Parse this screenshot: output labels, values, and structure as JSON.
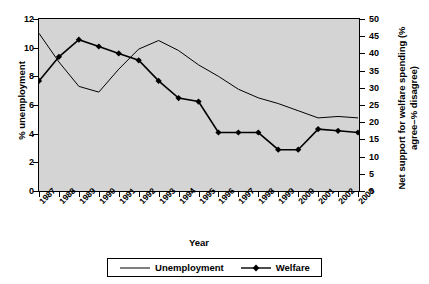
{
  "chart_data": {
    "type": "line",
    "title": "",
    "xlabel": "Year",
    "categories": [
      "1987",
      "1988",
      "1989",
      "1990",
      "1991",
      "1992",
      "1993",
      "1994",
      "1995",
      "1996",
      "1997",
      "1998",
      "1999",
      "2000",
      "2001",
      "2002",
      "2003"
    ],
    "grid": false,
    "legend_position": "bottom",
    "axes": {
      "left": {
        "label": "% unemployment",
        "min": 0,
        "max": 12,
        "step": 2,
        "ticks": [
          "0",
          "2",
          "4",
          "6",
          "8",
          "10",
          "12"
        ]
      },
      "right": {
        "label": "Net support for welfare spending (% agree–% disagree)",
        "min": 0,
        "max": 50,
        "step": 5,
        "ticks": [
          "0",
          "5",
          "10",
          "15",
          "20",
          "25",
          "30",
          "35",
          "40",
          "45",
          "50"
        ]
      }
    },
    "series": [
      {
        "name": "Unemployment",
        "axis": "left",
        "marker": "none",
        "color": "#000000",
        "values": [
          11.0,
          9.0,
          7.3,
          6.9,
          8.5,
          9.9,
          10.5,
          9.8,
          8.8,
          8.0,
          7.1,
          6.5,
          6.1,
          5.6,
          5.1,
          5.2,
          5.1
        ]
      },
      {
        "name": "Welfare",
        "axis": "right",
        "marker": "diamond",
        "color": "#000000",
        "values": [
          32,
          39,
          44,
          42,
          40,
          38,
          32,
          27,
          26,
          17,
          17,
          17,
          12,
          12,
          18,
          17.5,
          17
        ]
      }
    ]
  },
  "legend": {
    "items": [
      {
        "label": "Unemployment",
        "marker": "line"
      },
      {
        "label": "Welfare",
        "marker": "line-diamond"
      }
    ]
  },
  "icons": {
    "legend_line": "line-swatch-icon",
    "legend_diamond": "diamond-marker-icon"
  }
}
